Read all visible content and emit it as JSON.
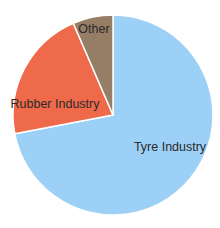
{
  "chart_data": {
    "type": "pie",
    "title": "",
    "start_angle": "12 o'clock",
    "direction": "clockwise",
    "legend": "none (labels inside slices)",
    "categories": [
      "Tyre Industry",
      "Rubber Industry",
      "Other"
    ],
    "values": [
      72,
      21.5,
      6.5
    ],
    "unit": "%",
    "colors": [
      "#9dd0f6",
      "#ee6a4b",
      "#967d66"
    ],
    "labels": [
      {
        "text": "Tyre Industry",
        "x": 170,
        "y": 151
      },
      {
        "text": "Rubber Industry",
        "x": 55,
        "y": 108
      },
      {
        "text": "Other",
        "x": 94,
        "y": 33
      }
    ]
  },
  "layout": {
    "cx": 113,
    "cy": 115,
    "r": 100
  }
}
